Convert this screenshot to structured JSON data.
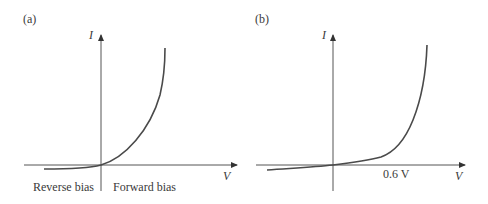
{
  "panels": [
    {
      "label": "(a)",
      "y_axis_label": "I",
      "x_axis_label": "V",
      "region_left": "Reverse bias",
      "region_right": "Forward bias"
    },
    {
      "label": "(b)",
      "y_axis_label": "I",
      "x_axis_label": "V",
      "knee_label": "0.6 V"
    }
  ],
  "colors": {
    "axis": "#555555",
    "curve": "#4a4a4a",
    "text": "#3a3a3a"
  }
}
